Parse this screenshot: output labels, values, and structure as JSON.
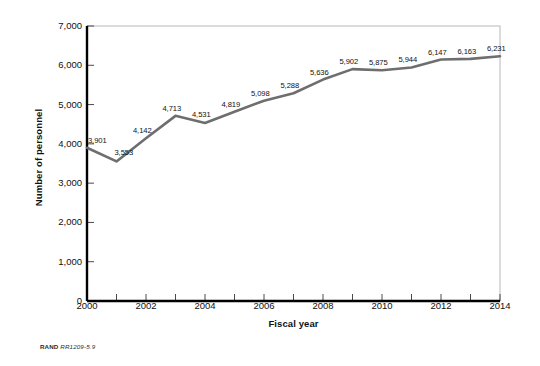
{
  "chart_data": {
    "type": "line",
    "title": "",
    "xlabel": "Fiscal year",
    "ylabel": "Number of personnel",
    "x": [
      2000,
      2001,
      2002,
      2003,
      2004,
      2005,
      2006,
      2007,
      2008,
      2009,
      2010,
      2011,
      2012,
      2013,
      2014
    ],
    "values": [
      3901,
      3553,
      4142,
      4713,
      4531,
      4819,
      5098,
      5288,
      5636,
      5902,
      5875,
      5944,
      6147,
      6163,
      6231
    ],
    "point_labels": [
      "3,901",
      "3,553",
      "4,142",
      "4,713",
      "4,531",
      "4,819",
      "5,098",
      "5,288",
      "5,636",
      "5,902",
      "5,875",
      "5,944",
      "6,147",
      "6,163",
      "6,231"
    ],
    "xlim": [
      2000,
      2014
    ],
    "ylim": [
      0,
      7000
    ],
    "x_tick_values": [
      2000,
      2001,
      2002,
      2003,
      2004,
      2005,
      2006,
      2007,
      2008,
      2009,
      2010,
      2011,
      2012,
      2013,
      2014
    ],
    "x_tick_labels": [
      "2000",
      "",
      "2002",
      "",
      "2004",
      "",
      "2006",
      "",
      "2008",
      "",
      "2010",
      "",
      "2012",
      "",
      "2014"
    ],
    "y_tick_values": [
      0,
      1000,
      2000,
      3000,
      4000,
      5000,
      6000,
      7000
    ],
    "y_tick_labels": [
      "0",
      "1,000",
      "2,000",
      "3,000",
      "4,000",
      "5,000",
      "6,000",
      "7,000"
    ],
    "grid": false,
    "legend": false,
    "series_color": "#6e6e6e",
    "axis_color": "#000000",
    "frame_color": "#b8b8b8"
  },
  "credit": {
    "organization": "RAND",
    "figure_id": "RR1209-5.9"
  }
}
